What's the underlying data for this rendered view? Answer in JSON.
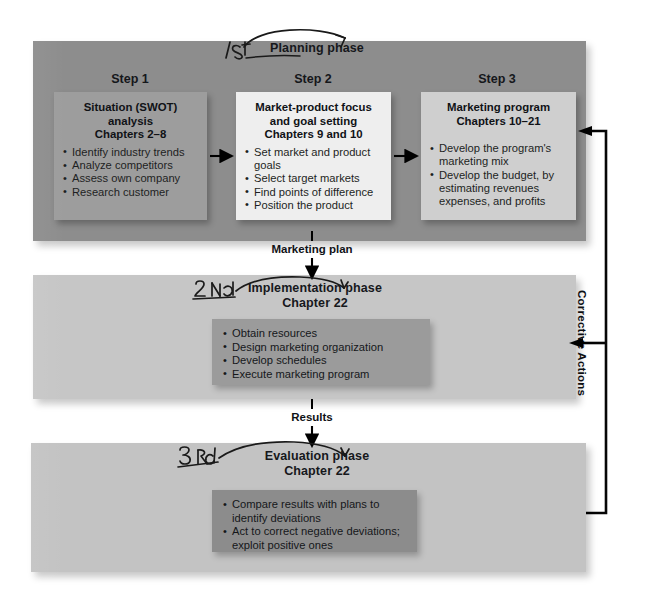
{
  "diagram": {
    "colors": {
      "band_planning": "#8d8d8d",
      "band_implementation": "#c6c6c6",
      "band_evaluation": "#c3c3c3",
      "box_step1": "#9d9d9d",
      "box_step2": "#eeeeee",
      "box_step3": "#cfcfcf",
      "panel_implementation": "#9b9b9b",
      "panel_evaluation": "#8c8c8c",
      "arrow": "#000000",
      "text": "#15171b",
      "page_background": "#ffffff"
    }
  },
  "phases": {
    "planning": {
      "caption": "Planning phase",
      "handwritten_marker": "1 St",
      "steps": [
        {
          "label": "Step 1",
          "title_lines": [
            "Situation (SWOT)",
            "analysis",
            "Chapters 2–8"
          ],
          "bullets": [
            "Identify industry trends",
            "Analyze competitors",
            "Assess own company",
            "Research customer"
          ]
        },
        {
          "label": "Step 2",
          "title_lines": [
            "Market-product focus",
            "and goal setting",
            "Chapters 9 and 10"
          ],
          "bullets": [
            "Set market and product goals",
            "Select target markets",
            "Find points of difference",
            "Position the product"
          ]
        },
        {
          "label": "Step 3",
          "title_lines": [
            "Marketing program",
            "Chapters 10–21"
          ],
          "bullets": [
            "Develop the program's marketing mix",
            "Develop the budget, by estimating revenues expenses, and profits"
          ]
        }
      ]
    },
    "implementation": {
      "caption_line1": "Implementation phase",
      "caption_line2": "Chapter 22",
      "handwritten_marker": "2 Nd",
      "bullets": [
        "Obtain resources",
        "Design marketing organization",
        "Develop schedules",
        "Execute marketing program"
      ]
    },
    "evaluation": {
      "caption_line1": "Evaluation phase",
      "caption_line2": "Chapter 22",
      "handwritten_marker": "3 Rd",
      "bullets": [
        "Compare results with plans to identify deviations",
        "Act to correct negative deviations; exploit positive ones"
      ]
    }
  },
  "connectors": {
    "step1_to_step2": "arrow-right",
    "step2_to_step3": "arrow-right",
    "planning_to_implementation": "Marketing plan",
    "implementation_to_evaluation": "Results",
    "feedback_label": "Corrective Actions"
  }
}
